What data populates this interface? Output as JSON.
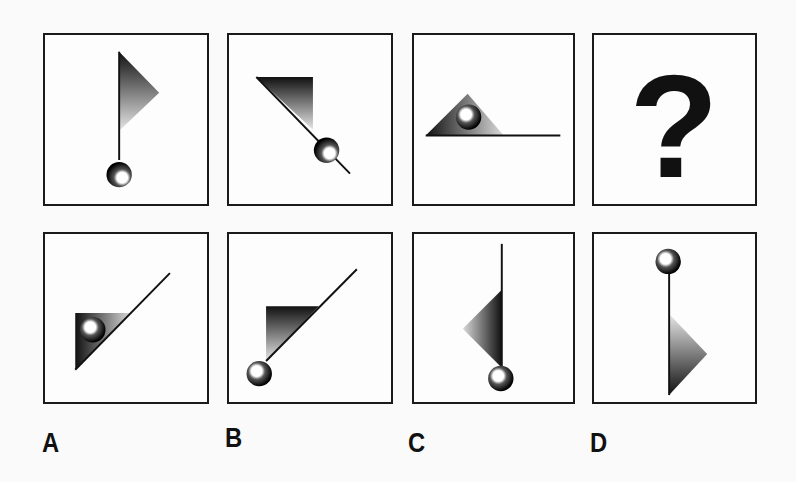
{
  "puzzle": {
    "question_row": [
      {
        "id": "q1",
        "description": "flag pointing right on vertical pole, ball at bottom"
      },
      {
        "id": "q2",
        "description": "flag rotated, diagonal pole, ball lower-right"
      },
      {
        "id": "q3",
        "description": "triangle on horizontal line with ball inside"
      },
      {
        "id": "q4",
        "description": "question mark",
        "symbol": "?"
      }
    ],
    "answer_row": [
      {
        "id": "A",
        "label": "A",
        "description": "diagonal line with triangle, ball inside triangle"
      },
      {
        "id": "B",
        "label": "B",
        "description": "diagonal line with triangle, ball at lower-left end"
      },
      {
        "id": "C",
        "label": "C",
        "description": "vertical line, triangle pointing left, ball at bottom"
      },
      {
        "id": "D",
        "label": "D",
        "description": "vertical line, ball on top, triangle pointing right at bottom"
      }
    ],
    "question_mark": "?"
  },
  "colors": {
    "border": "#1a1a1a",
    "background": "#fafafa",
    "shape_dark": "#111111",
    "shape_light": "#e0e0e0"
  }
}
